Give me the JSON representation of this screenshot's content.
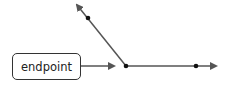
{
  "diagram": {
    "label": {
      "text": "endpoint"
    },
    "colors": {
      "line": "#555555",
      "dot": "#111111",
      "box_border": "#333333",
      "text": "#222222"
    },
    "elements": [
      {
        "type": "arrow",
        "name": "pointer-arrow",
        "from": [
          81,
          66
        ],
        "to": [
          116,
          66
        ]
      },
      {
        "type": "ray",
        "name": "ray-upper-left",
        "from": [
          126,
          66
        ],
        "to": [
          74,
          1
        ],
        "point": [
          88,
          18
        ]
      },
      {
        "type": "ray",
        "name": "ray-right",
        "from": [
          126,
          66
        ],
        "to": [
          219,
          66
        ],
        "point": [
          196,
          66
        ]
      },
      {
        "type": "point",
        "name": "endpoint-vertex",
        "at": [
          126,
          66
        ]
      }
    ]
  }
}
